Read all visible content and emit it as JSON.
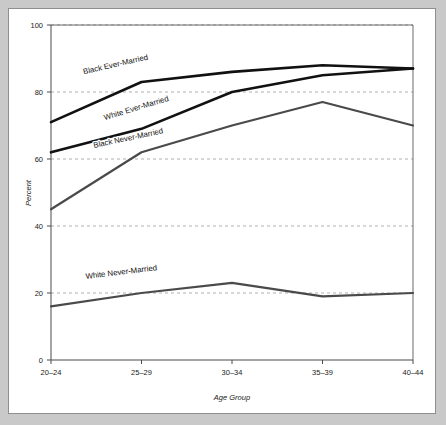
{
  "chart_data": {
    "type": "line",
    "title": "",
    "subtitle": "",
    "xlabel": "Age Group",
    "ylabel": "Percent",
    "categories": [
      "20–24",
      "25–29",
      "30–34",
      "35–39",
      "40–44"
    ],
    "ylim": [
      0,
      100
    ],
    "yticks": [
      0,
      20,
      40,
      60,
      80,
      100
    ],
    "ytick_labels": [
      "0",
      "20",
      "40",
      "60",
      "80",
      "100"
    ],
    "grid": "horizontal-dashed",
    "legend": "inline-series-labels",
    "series": [
      {
        "name": "Black Ever-Married",
        "values": [
          71,
          83,
          86,
          88,
          87
        ],
        "color": "#111111",
        "width": 2.6,
        "label_x": 0.72,
        "label_y": 87.5,
        "label_rotate": -13
      },
      {
        "name": "White Ever-Married",
        "values": [
          62,
          69,
          80,
          85,
          87
        ],
        "color": "#111111",
        "width": 2.6,
        "label_x": 0.95,
        "label_y": 74.5,
        "label_rotate": -17
      },
      {
        "name": "Black Never-Married",
        "values": [
          45,
          62,
          70,
          77,
          70
        ],
        "color": "#4a4a4a",
        "width": 2.2,
        "label_x": 0.86,
        "label_y": 65.5,
        "label_rotate": -12
      },
      {
        "name": "White Never-Married",
        "values": [
          16,
          20,
          23,
          19,
          20
        ],
        "color": "#4a4a4a",
        "width": 2.2,
        "label_x": 0.78,
        "label_y": 25.5,
        "label_rotate": -7
      }
    ]
  },
  "axes": {
    "y_axis_title": "Percent",
    "x_axis_title": "Age Group"
  }
}
